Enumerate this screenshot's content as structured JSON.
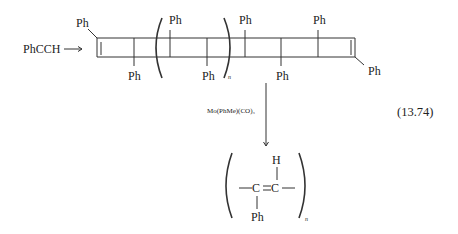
{
  "reactant": "PhCCH",
  "polymer_substituents": {
    "top_left": "Ph",
    "bottom_1": "Ph",
    "bracket_top": "Ph",
    "bracket_bottom": "Ph",
    "top_2": "Ph",
    "bottom_2": "Ph",
    "top_3": "Ph",
    "right_end": "Ph"
  },
  "repeat_subscript": "n",
  "catalyst": "Mo(PhMe)(CO)₃",
  "equation_number": "(13.74)",
  "product": {
    "atom_left": "C",
    "atom_right": "C",
    "top_substituent": "H",
    "bottom_substituent": "Ph",
    "subscript": "n"
  }
}
